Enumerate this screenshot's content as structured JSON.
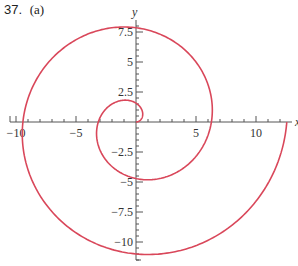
{
  "header": {
    "problem_label": "37.",
    "part_label": "(a)"
  },
  "colors": {
    "curve": "#d9475a",
    "axis": "#555555",
    "text": "#333333"
  },
  "chart_data": {
    "type": "line",
    "title": "37. (a)",
    "equation": "r = θ",
    "theta_range": [
      0,
      12.566
    ],
    "xlabel": "x",
    "ylabel": "y",
    "xlim": [
      -10.5,
      13
    ],
    "ylim": [
      -11.5,
      8.5
    ],
    "x_ticks": [
      -10,
      -5,
      5,
      10
    ],
    "x_tick_labels": [
      "−10",
      "−5",
      "5",
      "10"
    ],
    "y_ticks": [
      7.5,
      5,
      2.5,
      -2.5,
      -5,
      -7.5,
      -10
    ],
    "y_tick_labels": [
      "7.5",
      "5",
      "2.5",
      "−2.5",
      "−5",
      "−7.5",
      "−10"
    ],
    "grid": false,
    "legend": null,
    "key_points": [
      {
        "theta": 0,
        "x": 0,
        "y": 0
      },
      {
        "theta": 1.571,
        "x": 0,
        "y": 1.57
      },
      {
        "theta": 3.142,
        "x": -3.14,
        "y": 0
      },
      {
        "theta": 4.712,
        "x": 0,
        "y": -4.71
      },
      {
        "theta": 6.283,
        "x": 6.28,
        "y": 0
      },
      {
        "theta": 7.854,
        "x": 0,
        "y": 7.85
      },
      {
        "theta": 9.425,
        "x": -9.42,
        "y": 0
      },
      {
        "theta": 10.996,
        "x": 0,
        "y": -11.0
      },
      {
        "theta": 12.566,
        "x": 12.57,
        "y": 0
      }
    ]
  }
}
